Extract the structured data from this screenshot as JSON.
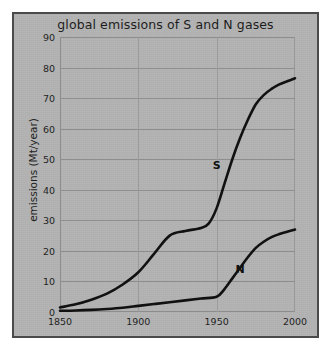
{
  "figure": {
    "background_color": "#b3b3b3",
    "frame_color": "#4a4a4a",
    "line_color": "#111111"
  },
  "chart_data": {
    "type": "line",
    "title": "global emissions of S and N gases",
    "xlabel": "",
    "ylabel": "emissions (Mt/year)",
    "xlim": [
      1850,
      2000
    ],
    "ylim": [
      0,
      90
    ],
    "xticks": [
      1850,
      1900,
      1950,
      2000
    ],
    "yticks": [
      0,
      10,
      20,
      30,
      40,
      50,
      60,
      70,
      80,
      90
    ],
    "grid": true,
    "legend": "inline-labels",
    "series": [
      {
        "name": "S",
        "label": "S",
        "label_x": 1950,
        "label_y": 48,
        "x": [
          1850,
          1860,
          1870,
          1880,
          1890,
          1900,
          1910,
          1920,
          1930,
          1940,
          1945,
          1950,
          1955,
          1960,
          1965,
          1970,
          1975,
          1980,
          1985,
          1990,
          1995,
          2000
        ],
        "y": [
          1.5,
          2.5,
          4,
          6,
          9,
          13,
          19,
          25,
          26.5,
          27.5,
          29,
          34,
          42,
          50,
          57,
          63,
          68,
          71,
          73,
          74.5,
          75.5,
          76.5
        ]
      },
      {
        "name": "N",
        "label": "N",
        "label_x": 1965,
        "label_y": 14,
        "x": [
          1850,
          1860,
          1870,
          1880,
          1890,
          1900,
          1910,
          1920,
          1930,
          1940,
          1950,
          1955,
          1960,
          1965,
          1970,
          1975,
          1980,
          1985,
          1990,
          1995,
          2000
        ],
        "y": [
          0.4,
          0.5,
          0.7,
          1,
          1.4,
          2,
          2.6,
          3.2,
          3.8,
          4.4,
          5,
          7.5,
          11,
          14.5,
          18,
          21,
          23,
          24.5,
          25.5,
          26.3,
          27
        ]
      }
    ]
  }
}
